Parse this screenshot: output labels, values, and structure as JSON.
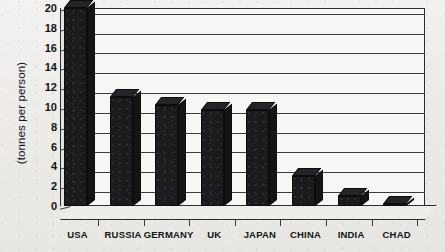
{
  "chart_data": {
    "type": "bar",
    "title": "",
    "subtitle": "",
    "xlabel": "",
    "ylabel": "(tonnes per person)",
    "categories": [
      "USA",
      "RUSSIA",
      "GERMANY",
      "UK",
      "JAPAN",
      "CHINA",
      "INDIA",
      "CHAD"
    ],
    "values": [
      20,
      11,
      10.2,
      9.7,
      9.7,
      3,
      1,
      0.1
    ],
    "series": [
      {
        "name": "",
        "values": [
          20,
          11,
          10.2,
          9.7,
          9.7,
          3,
          1,
          0.1
        ]
      }
    ],
    "ylim": [
      0,
      20
    ],
    "ytick_values": [
      0,
      2,
      4,
      6,
      8,
      10,
      12,
      14,
      16,
      18,
      20
    ],
    "ytick_labels": [
      "0",
      "2",
      "4",
      "6",
      "8",
      "10",
      "12",
      "14",
      "16",
      "18",
      "20"
    ],
    "grid": true,
    "grid_axis": "y",
    "legend": false,
    "legend_position": "none",
    "annotations": [],
    "style": {
      "three_d": true,
      "bar_color": "#1b1b1d",
      "grid_color": "#3a3b3d",
      "axis_color": "#2b2c2e",
      "plot_background": "#f7f6f4",
      "page_background": "#efeeec",
      "text_color": "#141518"
    }
  }
}
